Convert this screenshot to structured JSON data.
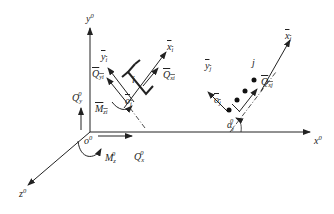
{
  "diagram": {
    "type": "structural-mechanics-coordinate-diagram",
    "global_axes": {
      "x": {
        "label": "x",
        "sup": "0"
      },
      "y": {
        "label": "y",
        "sup": "0"
      },
      "z": {
        "label": "z",
        "sup": "0"
      },
      "origin": {
        "label": "o",
        "sup": "0"
      }
    },
    "global_forces": {
      "Qx": {
        "label": "Q",
        "sub": "x",
        "sup": "0"
      },
      "Qy": {
        "label": "Q",
        "sub": "y",
        "sup": "0"
      },
      "Mz": {
        "label": "M",
        "sub": "z",
        "sup": "0"
      }
    },
    "element_i": {
      "node_label": "i",
      "origin": {
        "label": "o",
        "sub": "i"
      },
      "x_axis": {
        "label": "x",
        "sub": "i"
      },
      "y_axis": {
        "label": "y",
        "sub": "i"
      },
      "Qx": {
        "label": "Q",
        "sub": "xi"
      },
      "Qy": {
        "label": "Q",
        "sub": "yi"
      },
      "Mz": {
        "label": "M",
        "sub": "zi"
      }
    },
    "element_j": {
      "node_label": "j",
      "origin": {
        "label": "o",
        "sub": "j"
      },
      "x_axis": {
        "label": "x",
        "sub": "j"
      },
      "y_axis": {
        "label": "y",
        "sub": "j"
      },
      "Qx": {
        "label": "Q",
        "sub": "xj"
      },
      "angle": {
        "label": "α",
        "sub": "j",
        "sup": "0"
      }
    }
  }
}
